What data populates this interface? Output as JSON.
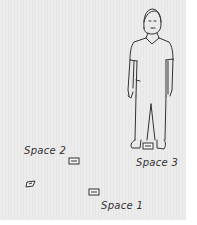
{
  "labels": {
    "space1": "Space 1",
    "space2": "Space 2",
    "space3": "Space 3"
  },
  "colors": {
    "background": "#e9e9e9",
    "ink": "#333333"
  }
}
